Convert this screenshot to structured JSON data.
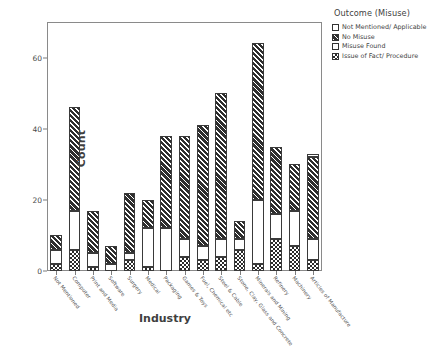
{
  "chart_data": {
    "type": "bar",
    "stacked": true,
    "title": "",
    "xlabel": "Industry",
    "ylabel": "Count",
    "ylim": [
      0,
      70
    ],
    "yticks": [
      0,
      20,
      40,
      60
    ],
    "grid": false,
    "legend_position": "right",
    "legend_title": "Outcome (Misuse)",
    "categories": [
      "Not Mentioned",
      "Computer",
      "Print and Media",
      "Software",
      "Surgery",
      "Medical",
      "Packaging",
      "Games & Toys",
      "Fuel, Chemical etc",
      "Steel & Cable",
      "Stone, Clay, Glass and Concrete",
      "Minerals and Mining",
      "Refinery",
      "Machinery",
      "Articles of Manufacture"
    ],
    "series": [
      {
        "name": "Issue of Fact/ Procedure",
        "pattern": "check",
        "values": [
          2,
          6,
          1,
          0,
          3,
          1,
          0,
          4,
          3,
          4,
          6,
          2,
          9,
          7,
          3
        ]
      },
      {
        "name": "Misuse Found",
        "pattern": "light",
        "values": [
          4,
          11,
          4,
          2,
          2,
          11,
          12,
          5,
          4,
          5,
          3,
          18,
          7,
          10,
          6
        ]
      },
      {
        "name": "No Misuse",
        "pattern": "hatch",
        "values": [
          4,
          29,
          12,
          5,
          17,
          8,
          26,
          29,
          34,
          41,
          5,
          44,
          19,
          13,
          23
        ]
      },
      {
        "name": "Not Mentioned/ Applicable",
        "pattern": "none",
        "values": [
          0,
          0,
          0,
          0,
          0,
          0,
          0,
          0,
          0,
          0,
          0,
          0,
          0,
          0,
          1
        ]
      }
    ],
    "totals": [
      10,
      46,
      17,
      7,
      22,
      20,
      38,
      38,
      41,
      50,
      14,
      65,
      35,
      30,
      33
    ],
    "legend_entries": [
      {
        "label": "Not Mentioned/ Applicable",
        "pattern": "none"
      },
      {
        "label": "No Misuse",
        "pattern": "hatch"
      },
      {
        "label": "Misuse Found",
        "pattern": "light"
      },
      {
        "label": "Issue of Fact/ Procedure",
        "pattern": "check"
      }
    ]
  }
}
